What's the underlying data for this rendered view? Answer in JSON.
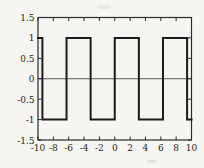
{
  "colors": {
    "background": "#f6f5f2",
    "wave_line": "#1c1c1c",
    "axis": "#2b2b2b",
    "zero_line": "#4a4a4a",
    "text": "#1e1e1e"
  },
  "chart_data": {
    "type": "line",
    "title": "",
    "xlabel": "",
    "ylabel": "",
    "xlim": [
      -10,
      10
    ],
    "ylim": [
      -1.5,
      1.5
    ],
    "xticks": [
      -10,
      -8,
      -6,
      -4,
      -2,
      0,
      2,
      4,
      6,
      8,
      10
    ],
    "xtick_labels": [
      "-10",
      "-8",
      "-6",
      "-4",
      "-2",
      "0",
      "2",
      "4",
      "6",
      "8",
      "10"
    ],
    "yticks": [
      -1.5,
      -1,
      -0.5,
      0,
      0.5,
      1,
      1.5
    ],
    "ytick_labels": [
      "-1.5",
      "-1",
      "-0.5",
      "0",
      "0.5",
      "1",
      "1.5"
    ],
    "grid": false,
    "legend": "none",
    "zero_line": true,
    "box": true,
    "series": [
      {
        "name": "square-wave",
        "amplitude": 1,
        "period": 6.2832,
        "points": [
          [
            -10,
            1
          ],
          [
            -9.4248,
            1
          ],
          [
            -9.4248,
            -1
          ],
          [
            -6.2832,
            -1
          ],
          [
            -6.2832,
            1
          ],
          [
            -3.1416,
            1
          ],
          [
            -3.1416,
            -1
          ],
          [
            0,
            -1
          ],
          [
            0,
            1
          ],
          [
            3.1416,
            1
          ],
          [
            3.1416,
            -1
          ],
          [
            6.2832,
            -1
          ],
          [
            6.2832,
            1
          ],
          [
            9.4248,
            1
          ],
          [
            9.4248,
            -1
          ],
          [
            10,
            -1
          ]
        ]
      }
    ]
  }
}
